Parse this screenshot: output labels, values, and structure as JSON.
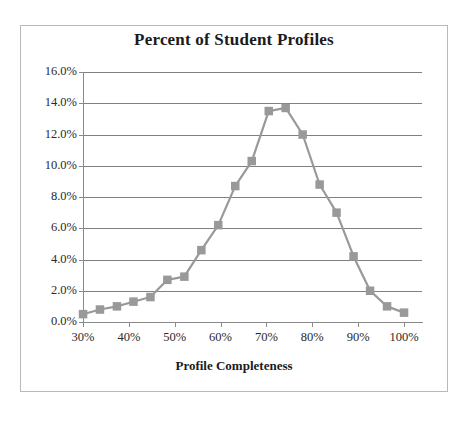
{
  "figure": {
    "title": "Percent of Student Profiles",
    "x_axis_title": "Profile Completeness",
    "marker_color": "#999999",
    "line_color": "#999999",
    "gridline_color": "#808080",
    "frame_color": "#b9b9b9",
    "text_color": "#1b1b1b"
  },
  "axes": {
    "y_tick_labels": [
      "16.0%",
      "14.0%",
      "12.0%",
      "10.0%",
      "8.0%",
      "6.0%",
      "4.0%",
      "2.0%",
      "0.0%"
    ],
    "x_tick_labels": [
      "30%",
      "40%",
      "50%",
      "60%",
      "70%",
      "80%",
      "90%",
      "100%"
    ]
  },
  "chart_data": {
    "type": "line",
    "title": "Percent of Student Profiles",
    "subtitle": "",
    "xlabel": "Profile Completeness",
    "ylabel": "",
    "xlim": [
      30,
      100
    ],
    "ylim": [
      0,
      16
    ],
    "x_tick_values": [
      30,
      40,
      50,
      60,
      70,
      80,
      90,
      100
    ],
    "y_tick_values": [
      0,
      2,
      4,
      6,
      8,
      10,
      12,
      14,
      16
    ],
    "x_tick_labels": [
      "30%",
      "40%",
      "50%",
      "60%",
      "70%",
      "80%",
      "90%",
      "100%"
    ],
    "y_tick_labels": [
      "0.0%",
      "2.0%",
      "4.0%",
      "6.0%",
      "8.0%",
      "10.0%",
      "12.0%",
      "14.0%",
      "16.0%"
    ],
    "grid": "horizontal",
    "legend": "none",
    "marker": "square",
    "series": [
      {
        "name": "Percent of Student Profiles",
        "x": [
          30.0,
          33.7,
          37.4,
          41.0,
          44.7,
          48.4,
          52.1,
          55.8,
          59.5,
          63.2,
          66.8,
          70.5,
          74.2,
          77.9,
          81.6,
          85.3,
          89.0,
          92.6,
          96.3,
          100.0
        ],
        "values": [
          0.5,
          0.8,
          1.0,
          1.3,
          1.6,
          2.7,
          2.9,
          4.6,
          6.2,
          8.7,
          10.3,
          13.5,
          13.7,
          12.0,
          8.8,
          7.0,
          4.2,
          2.0,
          1.0,
          0.6
        ]
      }
    ]
  }
}
